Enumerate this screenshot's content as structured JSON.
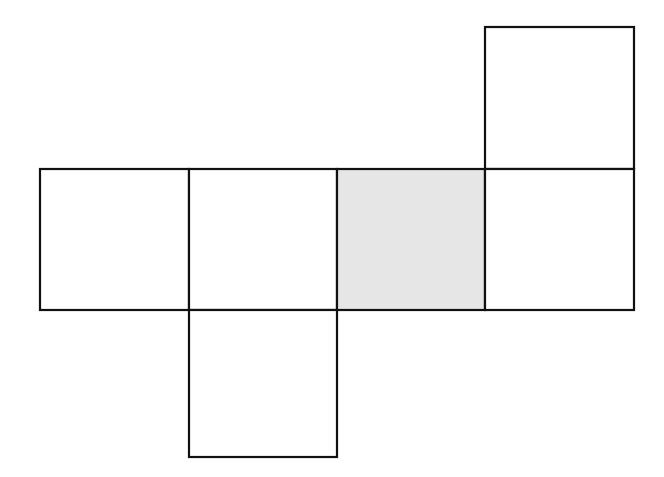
{
  "diagram": {
    "stroke_color": "#111111",
    "fill_shaded": "#e6e6e6",
    "fill_default": "#ffffff",
    "stroke_width": 2.2,
    "squares": [
      {
        "id": "top",
        "x": 485,
        "y": 27,
        "w": 149,
        "h": 142,
        "shaded": false
      },
      {
        "id": "row-1",
        "x": 40,
        "y": 169,
        "w": 149,
        "h": 141,
        "shaded": false
      },
      {
        "id": "row-2",
        "x": 189,
        "y": 169,
        "w": 148,
        "h": 141,
        "shaded": false
      },
      {
        "id": "row-3",
        "x": 337,
        "y": 169,
        "w": 148,
        "h": 141,
        "shaded": true
      },
      {
        "id": "row-4",
        "x": 485,
        "y": 169,
        "w": 149,
        "h": 141,
        "shaded": false
      },
      {
        "id": "bottom",
        "x": 189,
        "y": 310,
        "w": 148,
        "h": 147,
        "shaded": false
      }
    ]
  }
}
